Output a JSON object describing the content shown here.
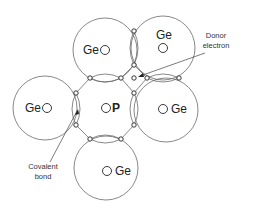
{
  "diagram": {
    "atoms": [
      {
        "id": "ge-top-left",
        "label": "Ge",
        "cx": 105,
        "cy": 50,
        "r": 32,
        "nx": 105,
        "ny": 50,
        "lx": 83,
        "ly": 54
      },
      {
        "id": "ge-top-right",
        "label": "Ge",
        "cx": 163,
        "cy": 48,
        "r": 32,
        "nx": 163,
        "ny": 48,
        "lx": 156,
        "ly": 39
      },
      {
        "id": "ge-left",
        "label": "Ge",
        "cx": 45,
        "cy": 108,
        "r": 32,
        "nx": 47,
        "ny": 108,
        "lx": 25,
        "ly": 112
      },
      {
        "id": "ge-right",
        "label": "Ge",
        "cx": 166,
        "cy": 110,
        "r": 32,
        "nx": 163,
        "ny": 109,
        "lx": 171,
        "ly": 113
      },
      {
        "id": "ge-bottom",
        "label": "Ge",
        "cx": 106,
        "cy": 168,
        "r": 32,
        "nx": 107,
        "ny": 171,
        "lx": 115,
        "ly": 175
      }
    ],
    "center_atom": {
      "id": "p-center",
      "label": "P",
      "nx": 106,
      "ny": 108,
      "lx": 112,
      "ly": 112
    },
    "electrons": [
      [
        134,
        31
      ],
      [
        134,
        65
      ],
      [
        90,
        78
      ],
      [
        121,
        78
      ],
      [
        134,
        78
      ],
      [
        147,
        78
      ],
      [
        179,
        78
      ],
      [
        76,
        93
      ],
      [
        76,
        125
      ],
      [
        134,
        93
      ],
      [
        134,
        125
      ],
      [
        90,
        139
      ],
      [
        121,
        139
      ]
    ],
    "annotations": {
      "donor_line1": "Donor",
      "donor_line2": "electron",
      "covalent_line1": "Covalent",
      "covalent_line2": "bond"
    }
  }
}
